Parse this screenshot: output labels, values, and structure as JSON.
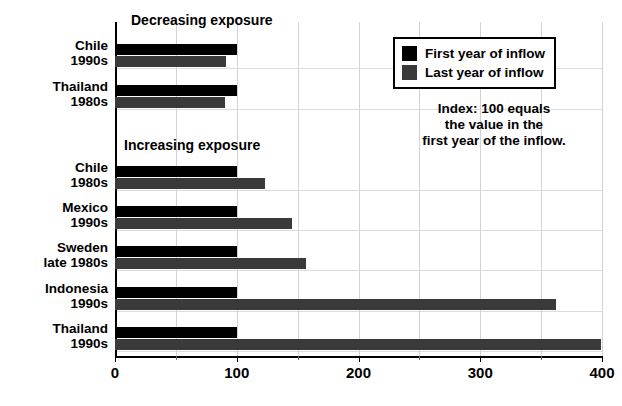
{
  "chart_data": {
    "type": "bar",
    "orientation": "horizontal",
    "title": "",
    "xlabel": "",
    "ylabel": "",
    "xlim": [
      0,
      400
    ],
    "xticks": [
      0,
      100,
      200,
      300,
      400
    ],
    "xtick_labels": [
      "0",
      "100",
      "200",
      "300",
      "400"
    ],
    "minor_xticks": [
      50,
      150,
      250,
      350
    ],
    "grid": true,
    "legend_position": "upper right",
    "series": [
      {
        "name": "First year of inflow",
        "color": "#000000",
        "values": [
          100,
          100,
          100,
          100,
          100,
          100,
          100
        ]
      },
      {
        "name": "Last year of inflow",
        "color": "#3a3a3a",
        "values": [
          91,
          90,
          123,
          145,
          157,
          362,
          399
        ]
      }
    ],
    "categories": [
      "Chile 1990s",
      "Thailand 1980s",
      "Chile 1980s",
      "Mexico 1990s",
      "Sweden late 1980s",
      "Indonesia 1990s",
      "Thailand 1990s"
    ],
    "groups": [
      {
        "title": "Decreasing exposure",
        "rows": [
          {
            "label_line1": "Chile",
            "label_line2": "1990s",
            "first": 100,
            "last": 91
          },
          {
            "label_line1": "Thailand",
            "label_line2": "1980s",
            "first": 100,
            "last": 90
          }
        ]
      },
      {
        "title": "Increasing exposure",
        "rows": [
          {
            "label_line1": "Chile",
            "label_line2": "1980s",
            "first": 100,
            "last": 123
          },
          {
            "label_line1": "Mexico",
            "label_line2": "1990s",
            "first": 100,
            "last": 145
          },
          {
            "label_line1": "Sweden",
            "label_line2": "late 1980s",
            "first": 100,
            "last": 157
          },
          {
            "label_line1": "Indonesia",
            "label_line2": "1990s",
            "first": 100,
            "last": 362
          },
          {
            "label_line1": "Thailand",
            "label_line2": "1990s",
            "first": 100,
            "last": 399
          }
        ]
      }
    ],
    "annotations": [
      "Index: 100 equals",
      "the value in the",
      "first year of the inflow."
    ],
    "colors": {
      "first_year": "#000000",
      "last_year": "#3a3a3a",
      "grid": "#d2d2d2",
      "axis": "#000000",
      "background": "#ffffff"
    }
  },
  "legend": {
    "items": [
      {
        "label": "First year of inflow",
        "swatch": "first"
      },
      {
        "label": "Last year of inflow",
        "swatch": "last"
      }
    ]
  },
  "sections": {
    "decreasing": "Decreasing exposure",
    "increasing": "Increasing exposure"
  },
  "note": {
    "line1": "Index: 100 equals",
    "line2": "the value in the",
    "line3": "first year of the inflow."
  },
  "axis": {
    "ticks": [
      "0",
      "100",
      "200",
      "300",
      "400"
    ]
  },
  "rows": [
    {
      "l1": "Chile",
      "l2": "1990s",
      "first": 100,
      "last": 91,
      "top": 44
    },
    {
      "l1": "Thailand",
      "l2": "1980s",
      "first": 100,
      "last": 90,
      "top": 85
    },
    {
      "l1": "Chile",
      "l2": "1980s",
      "first": 100,
      "last": 123,
      "top": 166
    },
    {
      "l1": "Mexico",
      "l2": "1990s",
      "first": 100,
      "last": 145,
      "top": 206
    },
    {
      "l1": "Sweden",
      "l2": "late 1980s",
      "first": 100,
      "last": 157,
      "top": 246
    },
    {
      "l1": "Indonesia",
      "l2": "1990s",
      "first": 100,
      "last": 362,
      "top": 287
    },
    {
      "l1": "Thailand",
      "l2": "1990s",
      "first": 100,
      "last": 399,
      "top": 327
    }
  ]
}
